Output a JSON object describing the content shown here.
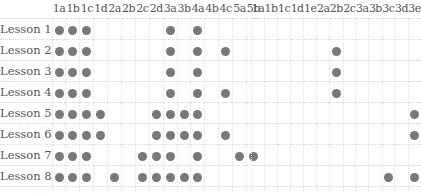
{
  "left_table": {
    "columns": [
      "1a",
      "1b",
      "1c",
      "1d",
      "2a",
      "2b",
      "2c",
      "2d",
      "3a",
      "3b",
      "4a",
      "4b",
      "4c",
      "5a",
      "5b"
    ],
    "rows": [
      {
        "label": "Lesson 1",
        "marks": [
          "1a",
          "1b",
          "1c",
          "3a",
          "4a"
        ]
      },
      {
        "label": "Lesson 2",
        "marks": [
          "1a",
          "1b",
          "1c",
          "3a",
          "4a",
          "4c"
        ]
      },
      {
        "label": "Lesson 3",
        "marks": [
          "1a",
          "1b",
          "1c",
          "3a",
          "4a"
        ]
      },
      {
        "label": "Lesson 4",
        "marks": [
          "1a",
          "1b",
          "1c",
          "3a",
          "4a",
          "4c"
        ]
      },
      {
        "label": "Lesson 5",
        "marks": [
          "1a",
          "1b",
          "1c",
          "1d",
          "2d",
          "3a",
          "3b",
          "4a"
        ]
      },
      {
        "label": "Lesson 6",
        "marks": [
          "1a",
          "1b",
          "1c",
          "1d",
          "2d",
          "3a",
          "3b",
          "4a",
          "4c"
        ]
      },
      {
        "label": "Lesson 7",
        "marks": [
          "1a",
          "1b",
          "1c",
          "2c",
          "2d",
          "3a",
          "4a",
          "5a",
          "5b"
        ]
      },
      {
        "label": "Lesson 8",
        "marks": [
          "1a",
          "1b",
          "1c",
          "2a",
          "2c",
          "2d",
          "3a",
          "3b",
          "4a"
        ]
      },
      {
        "label": "Lesson 9",
        "marks": [
          "1a",
          "1c",
          "2d",
          "3a",
          "4a"
        ]
      }
    ]
  },
  "right_table": {
    "columns": [
      "1a",
      "1b",
      "1c",
      "1d",
      "1e",
      "2a",
      "2b",
      "2c",
      "3a",
      "3b",
      "3c",
      "3d",
      "3e"
    ],
    "rows": [
      {
        "marks": []
      },
      {
        "marks": [
          "2b"
        ]
      },
      {
        "marks": [
          "2b"
        ]
      },
      {
        "marks": [
          "2b"
        ]
      },
      {
        "marks": [
          "3e"
        ]
      },
      {
        "marks": [
          "3e"
        ]
      },
      {
        "marks": []
      },
      {
        "marks": [
          "3c",
          "3e"
        ]
      },
      {
        "marks": []
      }
    ]
  },
  "colors": {
    "dot": "#787878",
    "grid": "#d8d8d8",
    "text": "#555555"
  }
}
